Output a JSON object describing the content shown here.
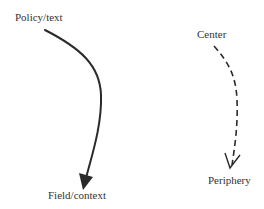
{
  "diagram": {
    "left": {
      "top_label": "Policy/text",
      "bottom_label": "Field/context",
      "arrow_style": "solid",
      "arrowhead": "filled-triangle"
    },
    "right": {
      "top_label": "Center",
      "bottom_label": "Periphery",
      "arrow_style": "dashed",
      "arrowhead": "open-v"
    },
    "colors": {
      "stroke": "#2a2a2a",
      "text": "#333333",
      "background": "#ffffff"
    }
  }
}
